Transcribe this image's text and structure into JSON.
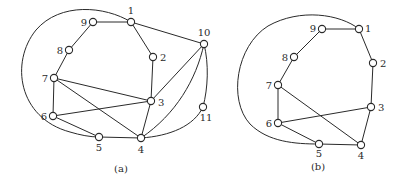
{
  "figure": {
    "panels": [
      {
        "id": "a",
        "caption": "(a)",
        "caption_pos": [
          121,
          172
        ],
        "nodes": [
          {
            "id": "1",
            "x": 131,
            "y": 22,
            "label": "1",
            "lx": 131,
            "ly": 14,
            "anchor": "middle"
          },
          {
            "id": "2",
            "x": 153,
            "y": 57,
            "label": "2",
            "lx": 160,
            "ly": 61,
            "anchor": "start"
          },
          {
            "id": "3",
            "x": 151,
            "y": 101,
            "label": "3",
            "lx": 158,
            "ly": 106,
            "anchor": "start"
          },
          {
            "id": "4",
            "x": 141,
            "y": 138,
            "label": "4",
            "lx": 141,
            "ly": 153,
            "anchor": "middle"
          },
          {
            "id": "5",
            "x": 99,
            "y": 137,
            "label": "5",
            "lx": 99,
            "ly": 151,
            "anchor": "middle"
          },
          {
            "id": "6",
            "x": 53,
            "y": 116,
            "label": "6",
            "lx": 47,
            "ly": 120,
            "anchor": "end"
          },
          {
            "id": "7",
            "x": 54,
            "y": 78,
            "label": "7",
            "lx": 48,
            "ly": 82,
            "anchor": "end"
          },
          {
            "id": "8",
            "x": 69,
            "y": 50,
            "label": "8",
            "lx": 63,
            "ly": 54,
            "anchor": "end"
          },
          {
            "id": "9",
            "x": 93,
            "y": 22,
            "label": "9",
            "lx": 87,
            "ly": 26,
            "anchor": "end"
          },
          {
            "id": "10",
            "x": 204,
            "y": 44,
            "label": "10",
            "lx": 204,
            "ly": 36,
            "anchor": "middle"
          },
          {
            "id": "11",
            "x": 203,
            "y": 107,
            "label": "11",
            "lx": 206,
            "ly": 121,
            "anchor": "middle"
          }
        ],
        "edges": [
          {
            "from": "9",
            "to": "1"
          },
          {
            "from": "1",
            "to": "2"
          },
          {
            "from": "1",
            "to": "10"
          },
          {
            "from": "2",
            "to": "3"
          },
          {
            "from": "9",
            "to": "8"
          },
          {
            "from": "8",
            "to": "7"
          },
          {
            "from": "7",
            "to": "6"
          },
          {
            "from": "7",
            "to": "3"
          },
          {
            "from": "7",
            "to": "4"
          },
          {
            "from": "6",
            "to": "3"
          },
          {
            "from": "6",
            "to": "5"
          },
          {
            "from": "5",
            "to": "4"
          },
          {
            "from": "3",
            "to": "4"
          },
          {
            "from": "10",
            "to": "3"
          },
          {
            "from": "10",
            "to": "4",
            "path": "M204,44 C196,80 176,114 141,138"
          },
          {
            "from": "10",
            "to": "11",
            "path": "M204,44 C209,64 208,88 203,107"
          },
          {
            "from": "11",
            "to": "4",
            "path": "M203,107 C194,126 170,136 141,138"
          },
          {
            "from": "1",
            "to": "5",
            "path": "M131,22 C105,6 60,2 36,30 C10,62 18,118 70,132 C80,135 90,137 99,137"
          }
        ]
      },
      {
        "id": "b",
        "caption": "(b)",
        "caption_pos": [
          318,
          170
        ],
        "nodes": [
          {
            "id": "1",
            "x": 359,
            "y": 29,
            "label": "1",
            "lx": 365,
            "ly": 32,
            "anchor": "start"
          },
          {
            "id": "2",
            "x": 373,
            "y": 63,
            "label": "2",
            "lx": 380,
            "ly": 67,
            "anchor": "start"
          },
          {
            "id": "3",
            "x": 371,
            "y": 107,
            "label": "3",
            "lx": 378,
            "ly": 111,
            "anchor": "start"
          },
          {
            "id": "4",
            "x": 361,
            "y": 145,
            "label": "4",
            "lx": 361,
            "ly": 159,
            "anchor": "middle"
          },
          {
            "id": "5",
            "x": 319,
            "y": 144,
            "label": "5",
            "lx": 319,
            "ly": 157,
            "anchor": "middle"
          },
          {
            "id": "6",
            "x": 278,
            "y": 123,
            "label": "6",
            "lx": 272,
            "ly": 127,
            "anchor": "end"
          },
          {
            "id": "7",
            "x": 278,
            "y": 85,
            "label": "7",
            "lx": 272,
            "ly": 89,
            "anchor": "end"
          },
          {
            "id": "8",
            "x": 294,
            "y": 57,
            "label": "8",
            "lx": 288,
            "ly": 61,
            "anchor": "end"
          },
          {
            "id": "9",
            "x": 322,
            "y": 29,
            "label": "9",
            "lx": 316,
            "ly": 32,
            "anchor": "end"
          }
        ],
        "edges": [
          {
            "from": "9",
            "to": "1"
          },
          {
            "from": "1",
            "to": "2"
          },
          {
            "from": "2",
            "to": "3"
          },
          {
            "from": "3",
            "to": "4"
          },
          {
            "from": "9",
            "to": "8"
          },
          {
            "from": "8",
            "to": "7"
          },
          {
            "from": "7",
            "to": "6"
          },
          {
            "from": "7",
            "to": "4"
          },
          {
            "from": "6",
            "to": "3"
          },
          {
            "from": "6",
            "to": "5"
          },
          {
            "from": "5",
            "to": "4"
          },
          {
            "from": "1",
            "to": "5",
            "path": "M359,29 C340,14 300,8 268,26 C236,46 228,100 250,124 C268,142 295,144 319,144"
          }
        ]
      }
    ]
  },
  "style": {
    "stroke_color": "#2a2a2a",
    "node_fill": "#ffffff",
    "background": "#ffffff",
    "node_radius": 3.6
  }
}
